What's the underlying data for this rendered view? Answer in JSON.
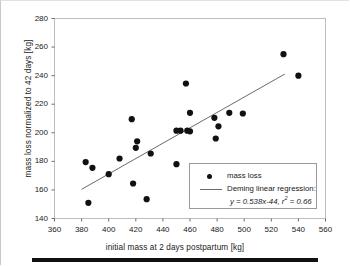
{
  "chart_data": {
    "type": "scatter",
    "title": "",
    "xlabel": "initial mass at 2 days postpartum [kg]",
    "ylabel": "mass loss normalized to 42 days [kg]",
    "xlim": [
      360,
      560
    ],
    "ylim": [
      140,
      280
    ],
    "xticks": [
      360,
      380,
      400,
      420,
      440,
      460,
      480,
      500,
      520,
      540,
      560
    ],
    "yticks": [
      140,
      160,
      180,
      200,
      220,
      240,
      260,
      280
    ],
    "grid": false,
    "legend_position": "lower-right",
    "marker_color": "#111111",
    "line_color": "#6b6b6b",
    "series": [
      {
        "name": "mass loss",
        "type": "scatter",
        "points": [
          [
            383,
            179.5
          ],
          [
            385,
            151.0
          ],
          [
            388,
            175.5
          ],
          [
            400,
            171.0
          ],
          [
            408,
            182.0
          ],
          [
            417,
            209.5
          ],
          [
            418,
            164.5
          ],
          [
            420,
            189.5
          ],
          [
            421,
            194.0
          ],
          [
            428,
            153.5
          ],
          [
            431,
            185.5
          ],
          [
            450,
            178.0
          ],
          [
            450,
            201.5
          ],
          [
            453,
            201.5
          ],
          [
            457,
            234.5
          ],
          [
            458,
            201.5
          ],
          [
            460,
            201.0
          ],
          [
            460,
            214.0
          ],
          [
            478,
            210.5
          ],
          [
            479,
            196.0
          ],
          [
            481,
            204.5
          ],
          [
            489,
            214.0
          ],
          [
            499,
            213.5
          ],
          [
            529,
            255.0
          ],
          [
            540,
            240.0
          ]
        ]
      },
      {
        "name": "Deming linear regression",
        "type": "line",
        "slope": 0.538,
        "intercept": -44,
        "r_squared": 0.66,
        "x_range": [
          380,
          530
        ]
      }
    ],
    "legend": {
      "scatter_label": "mass loss",
      "line_label": "Deming linear regression:",
      "equation_prefix": "y = 0.538x-44, r",
      "equation_exponent": "2",
      "equation_suffix": " = 0.66"
    }
  }
}
